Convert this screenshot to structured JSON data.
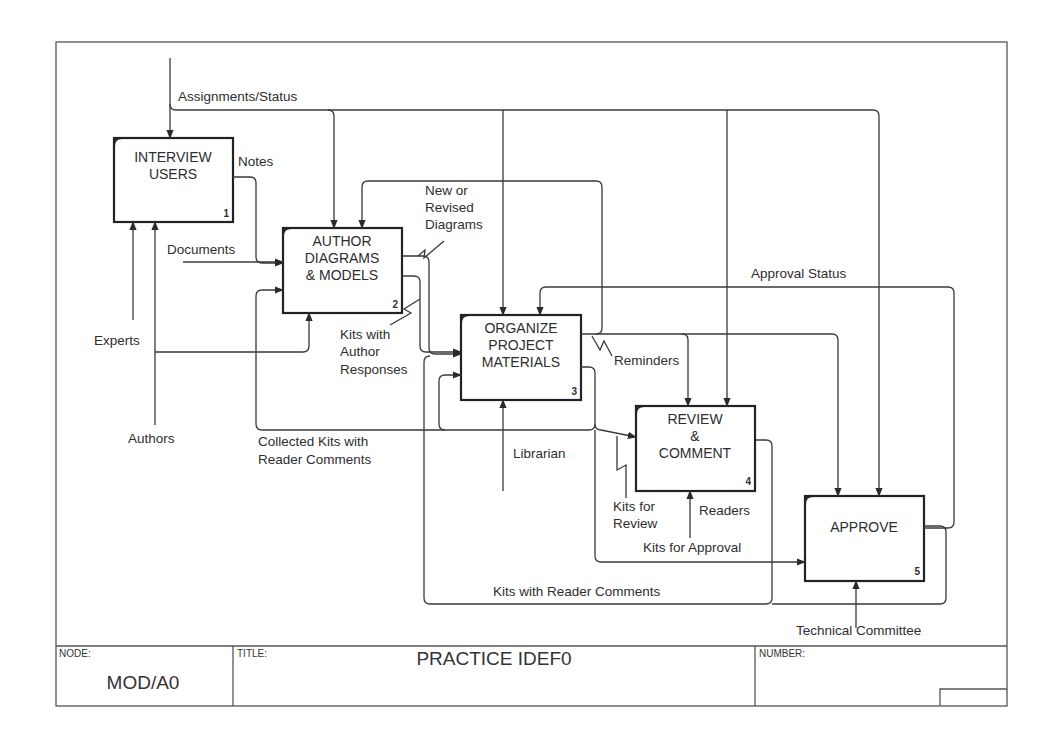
{
  "diagram": {
    "type": "IDEF0",
    "frame": {
      "x": 56,
      "y": 42,
      "w": 951,
      "h": 664
    },
    "colors": {
      "line": "#3a3a3a",
      "box_border": "#222222",
      "text": "#2e2e2e",
      "background": "#ffffff"
    },
    "activities": [
      {
        "id": "1",
        "lines": [
          "INTERVIEW",
          "USERS"
        ],
        "number": "1",
        "x": 114,
        "y": 138,
        "w": 119,
        "h": 84
      },
      {
        "id": "2",
        "lines": [
          "AUTHOR",
          "DIAGRAMS",
          "& MODELS"
        ],
        "number": "2",
        "x": 283,
        "y": 228,
        "w": 119,
        "h": 85
      },
      {
        "id": "3",
        "lines": [
          "ORGANIZE",
          "PROJECT",
          "MATERIALS"
        ],
        "number": "3",
        "x": 461,
        "y": 315,
        "w": 120,
        "h": 85
      },
      {
        "id": "4",
        "lines": [
          "REVIEW",
          "&",
          "COMMENT"
        ],
        "number": "4",
        "x": 636,
        "y": 406,
        "w": 119,
        "h": 85
      },
      {
        "id": "5",
        "lines": [
          "APPROVE"
        ],
        "number": "5",
        "x": 805,
        "y": 496,
        "w": 119,
        "h": 85
      }
    ],
    "arrow_labels": {
      "assignments_status": "Assignments/Status",
      "notes": "Notes",
      "documents": "Documents",
      "new_or_revised_diagrams": [
        "New or",
        "Revised",
        "Diagrams"
      ],
      "experts": "Experts",
      "authors": "Authors",
      "kits_with_author_responses": [
        "Kits with",
        "Author",
        "Responses"
      ],
      "reminders": "Reminders",
      "approval_status": "Approval Status",
      "collected_kits": [
        "Collected Kits with",
        "Reader Comments"
      ],
      "librarian": "Librarian",
      "kits_for_review": [
        "Kits for",
        "Review"
      ],
      "readers": "Readers",
      "kits_for_approval": "Kits for Approval",
      "kits_with_reader_comments": "Kits with Reader Comments",
      "technical_committee": "Technical Committee"
    }
  },
  "title_block": {
    "node_label": "NODE:",
    "node_value": "MOD/A0",
    "title_label": "TITLE:",
    "title_value": "PRACTICE IDEF0",
    "number_label": "NUMBER:",
    "number_value": ""
  }
}
